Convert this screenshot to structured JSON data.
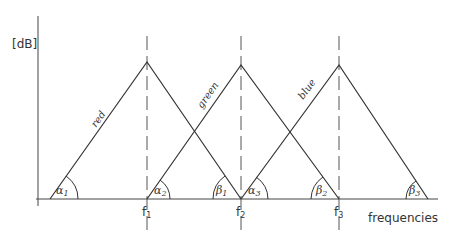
{
  "diagram": {
    "y_axis_label": "[dB]",
    "x_axis_label": "frequencies",
    "frequency_marks": [
      "f1",
      "f2",
      "f3"
    ],
    "curves": [
      {
        "name": "red",
        "label": "red",
        "start_x": 50,
        "peak_x": 147,
        "end_x": 241,
        "start_angle": "α1",
        "end_angle": "β1"
      },
      {
        "name": "green",
        "label": "green",
        "start_x": 147,
        "peak_x": 241,
        "end_x": 339,
        "start_angle": "α2",
        "end_angle": "β2"
      },
      {
        "name": "blue",
        "label": "blue",
        "start_x": 241,
        "peak_x": 339,
        "end_x": 428,
        "start_angle": "α3",
        "end_angle": "β3"
      }
    ],
    "angle_labels": {
      "a1": "α",
      "a1s": "1",
      "a2": "α",
      "a2s": "2",
      "a3": "α",
      "a3s": "3",
      "b1": "β",
      "b1s": "1",
      "b2": "β",
      "b2s": "2",
      "b3": "β",
      "b3s": "3"
    },
    "f_labels": {
      "f1": "f",
      "f1s": "1",
      "f2": "f",
      "f2s": "2",
      "f3": "f",
      "f3s": "3"
    },
    "line_color": "#333333"
  }
}
